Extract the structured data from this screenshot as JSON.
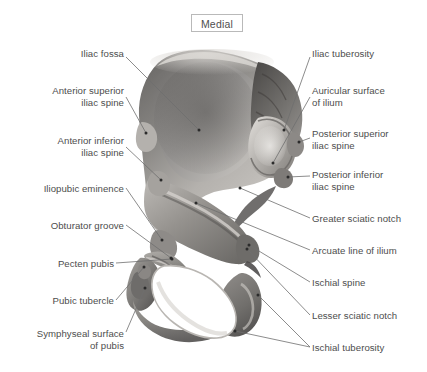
{
  "figure": {
    "orientation_badge": "Medial",
    "background_color": "#ffffff",
    "label_color": "#4d4d4d",
    "leader_color": "#6e6e6e",
    "badge_border_color": "#b9b9b9",
    "bone_tone_light": "#e8e6e3",
    "bone_tone_mid": "#a9a7a4",
    "bone_tone_dark": "#5d5b59"
  },
  "labels": {
    "left": [
      {
        "name": "iliac-fossa",
        "text": "Iliac fossa",
        "x": 14,
        "y": 48,
        "w": 110,
        "lines": 1
      },
      {
        "name": "anterior-superior-iliac-spine",
        "text": "Anterior superior\niliac spine",
        "x": 14,
        "y": 85,
        "w": 110,
        "lines": 2
      },
      {
        "name": "anterior-inferior-iliac-spine",
        "text": "Anterior inferior\niliac spine",
        "x": 14,
        "y": 135,
        "w": 110,
        "lines": 2
      },
      {
        "name": "iliopubic-eminence",
        "text": "Iliopubic eminence",
        "x": 6,
        "y": 183,
        "w": 118,
        "lines": 1
      },
      {
        "name": "obturator-groove",
        "text": "Obturator groove",
        "x": 6,
        "y": 220,
        "w": 118,
        "lines": 1
      },
      {
        "name": "pecten-pubis",
        "text": "Pecten pubis",
        "x": 14,
        "y": 258,
        "w": 100,
        "lines": 1
      },
      {
        "name": "pubic-tubercle",
        "text": "Pubic tubercle",
        "x": 10,
        "y": 295,
        "w": 104,
        "lines": 1
      },
      {
        "name": "symphyseal-surface-of-pubis",
        "text": "Symphyseal surface\nof pubis",
        "x": 4,
        "y": 328,
        "w": 120,
        "lines": 2
      }
    ],
    "right": [
      {
        "name": "iliac-tuberosity",
        "text": "Iliac tuberosity",
        "x": 312,
        "y": 48,
        "w": 112,
        "lines": 1
      },
      {
        "name": "auricular-surface-of-ilium",
        "text": "Auricular surface\nof ilium",
        "x": 312,
        "y": 85,
        "w": 112,
        "lines": 2
      },
      {
        "name": "posterior-superior-iliac-spine",
        "text": "Posterior superior\niliac spine",
        "x": 312,
        "y": 128,
        "w": 114,
        "lines": 2
      },
      {
        "name": "posterior-inferior-iliac-spine",
        "text": "Posterior inferior\niliac spine",
        "x": 312,
        "y": 169,
        "w": 114,
        "lines": 2
      },
      {
        "name": "greater-sciatic-notch",
        "text": "Greater sciatic notch",
        "x": 312,
        "y": 213,
        "w": 114,
        "lines": 1
      },
      {
        "name": "arcuate-line-of-ilium",
        "text": "Arcuate line of ilium",
        "x": 312,
        "y": 245,
        "w": 114,
        "lines": 1
      },
      {
        "name": "ischial-spine",
        "text": "Ischial spine",
        "x": 312,
        "y": 277,
        "w": 114,
        "lines": 1
      },
      {
        "name": "lesser-sciatic-notch",
        "text": "Lesser sciatic notch",
        "x": 312,
        "y": 310,
        "w": 114,
        "lines": 1
      },
      {
        "name": "ischial-tuberosity",
        "text": "Ischial tuberosity",
        "x": 312,
        "y": 342,
        "w": 114,
        "lines": 1
      }
    ]
  },
  "leaders": [
    {
      "name": "leader-iliac-fossa",
      "from": [
        126,
        57
      ],
      "to": [
        199,
        130
      ]
    },
    {
      "name": "leader-anterior-superior-iliac-spine",
      "from": [
        126,
        97
      ],
      "to": [
        146,
        133
      ]
    },
    {
      "name": "leader-anterior-inferior-iliac-spine",
      "from": [
        126,
        147
      ],
      "to": [
        161,
        180
      ]
    },
    {
      "name": "leader-iliopubic-eminence",
      "from": [
        126,
        188
      ],
      "to": [
        162,
        240
      ]
    },
    {
      "name": "leader-obturator-groove",
      "from": [
        126,
        225
      ],
      "to": [
        171,
        258
      ]
    },
    {
      "name": "leader-pecten-pubis",
      "from": [
        116,
        263
      ],
      "to": [
        172,
        259
      ]
    },
    {
      "name": "leader-pubic-tubercle",
      "from": [
        116,
        300
      ],
      "to": [
        144,
        267
      ]
    },
    {
      "name": "leader-symphyseal-surface",
      "from": [
        126,
        332
      ],
      "to": [
        145,
        288
      ]
    },
    {
      "name": "leader-iliac-tuberosity",
      "from": [
        310,
        57
      ],
      "to": [
        284,
        130
      ]
    },
    {
      "name": "leader-auricular-surface",
      "from": [
        310,
        97
      ],
      "to": [
        273,
        163
      ]
    },
    {
      "name": "leader-posterior-superior-iliac-spine",
      "from": [
        310,
        138
      ],
      "to": [
        299,
        142
      ]
    },
    {
      "name": "leader-posterior-inferior-iliac-spine",
      "from": [
        310,
        176
      ],
      "to": [
        288,
        177
      ]
    },
    {
      "name": "leader-greater-sciatic-notch",
      "from": [
        310,
        218
      ],
      "to": [
        240,
        188
      ]
    },
    {
      "name": "leader-arcuate-line-of-ilium",
      "from": [
        310,
        250
      ],
      "to": [
        196,
        203
      ]
    },
    {
      "name": "leader-ischial-spine",
      "from": [
        310,
        282
      ],
      "to": [
        249,
        245
      ]
    },
    {
      "name": "leader-lesser-sciatic-notch",
      "from": [
        310,
        315
      ],
      "to": [
        247,
        249
      ]
    },
    {
      "name": "leader-ischial-tuberosity-a",
      "from": [
        310,
        347
      ],
      "to": [
        258,
        295
      ]
    },
    {
      "name": "leader-ischial-tuberosity-b",
      "from": [
        310,
        347
      ],
      "to": [
        235,
        331
      ]
    }
  ]
}
